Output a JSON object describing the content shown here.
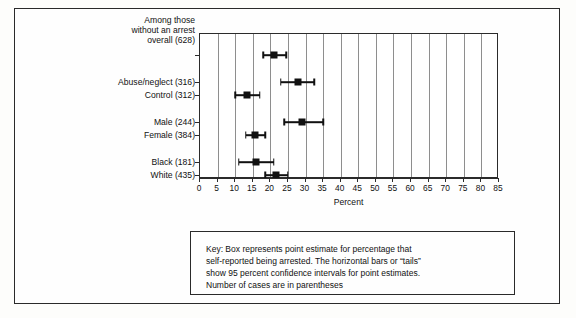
{
  "chart_data": {
    "type": "scatter",
    "title": "",
    "xlabel": "Percent",
    "ylabel": "",
    "xlim": [
      0,
      85
    ],
    "xtick_step": 5,
    "xticks": [
      0,
      5,
      10,
      15,
      20,
      25,
      30,
      35,
      40,
      45,
      50,
      55,
      60,
      65,
      70,
      75,
      80,
      85
    ],
    "grid": "vertical",
    "legend": "none",
    "categories": [
      "Among those without an arrest overall (628)",
      "Abuse/neglect (316)",
      "Control (312)",
      "Male (244)",
      "Female (384)",
      "Black (181)",
      "White (435)"
    ],
    "point_estimates": [
      21.0,
      28.0,
      13.5,
      29.0,
      15.5,
      16.0,
      21.5
    ],
    "ci_low": [
      18.0,
      23.0,
      10.0,
      24.0,
      13.0,
      11.0,
      18.5
    ],
    "ci_high": [
      24.5,
      32.5,
      17.0,
      35.0,
      18.5,
      21.0,
      25.0
    ],
    "n_cases": [
      628,
      316,
      312,
      244,
      384,
      181,
      435
    ],
    "series": [
      {
        "name": "Percent self-reported being arrested",
        "points": [
          {
            "label": "Among those without an arrest overall (628)",
            "value": 21.0,
            "ci_low": 18.0,
            "ci_high": 24.5
          },
          {
            "label": "Abuse/neglect (316)",
            "value": 28.0,
            "ci_low": 23.0,
            "ci_high": 32.5
          },
          {
            "label": "Control (312)",
            "value": 13.5,
            "ci_low": 10.0,
            "ci_high": 17.0
          },
          {
            "label": "Male (244)",
            "value": 29.0,
            "ci_low": 24.0,
            "ci_high": 35.0
          },
          {
            "label": "Female (384)",
            "value": 15.5,
            "ci_low": 13.0,
            "ci_high": 18.5
          },
          {
            "label": "Black (181)",
            "value": 16.0,
            "ci_low": 11.0,
            "ci_high": 21.0
          },
          {
            "label": "White (435)",
            "value": 21.5,
            "ci_low": 18.5,
            "ci_high": 25.0
          }
        ]
      }
    ],
    "annotations": [
      "Key: Box represents point estimate for percentage that",
      "self-reported being arrested. The horizontal bars or “tails”",
      "show 95 percent confidence intervals for point estimates.",
      "Number of cases are in parentheses"
    ]
  },
  "axis": {
    "x_title": "Percent"
  },
  "y_axis_labels": {
    "row0_line1": "Among those",
    "row0_line2": "without an arrest",
    "row0_line3": "overall (628)",
    "row1": "Abuse/neglect (316)",
    "row2": "Control (312)",
    "row3": "Male (244)",
    "row4": "Female (384)",
    "row5": "Black (181)",
    "row6": "White (435)"
  },
  "key": {
    "line1": "Key: Box represents point estimate for percentage that",
    "line2": "self-reported being arrested. The horizontal bars or “tails”",
    "line3": "show 95 percent confidence intervals for point estimates.",
    "line4": "Number of cases are in parentheses"
  },
  "colors": {
    "marker": "#111111",
    "grid": "#8e8e8e",
    "frame": "#2a2a2a",
    "background": "#fefefe"
  }
}
